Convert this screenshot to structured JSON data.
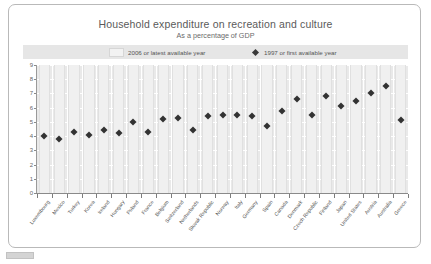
{
  "chart_data": {
    "type": "scatter",
    "title": "Household expenditure on recreation and culture",
    "subtitle": "As a percentage of GDP",
    "xlabel": "",
    "ylabel": "",
    "ylim": [
      0,
      9
    ],
    "ytick_labels": [
      "0",
      "1",
      "2",
      "3",
      "4",
      "5",
      "6",
      "7",
      "8",
      "9"
    ],
    "grid": true,
    "legend_position": "top",
    "legend": [
      {
        "label": "2006 or latest available year",
        "marker": "bar-swatch"
      },
      {
        "label": "1997 or first available year",
        "marker": "diamond"
      }
    ],
    "categories": [
      "Luxembourg",
      "Mexico",
      "Turkey",
      "Korea",
      "Ireland",
      "Hungary",
      "Poland",
      "France",
      "Belgium",
      "Switzerland",
      "Netherlands",
      "Slovak Republic",
      "Norway",
      "Italy",
      "Germany",
      "Spain",
      "Canada",
      "Denmark",
      "Czech Republic",
      "Finland",
      "Japan",
      "United States",
      "Austria",
      "Australia",
      "Greece"
    ],
    "series": [
      {
        "name": "1997 or first available year",
        "marker": "diamond",
        "color": "#333333",
        "values": [
          4.0,
          3.8,
          4.3,
          4.1,
          4.4,
          4.2,
          5.0,
          4.3,
          5.2,
          5.3,
          4.4,
          5.4,
          5.5,
          5.5,
          5.4,
          4.7,
          5.8,
          6.6,
          5.5,
          6.8,
          6.1,
          6.5,
          7.0,
          7.5,
          5.1
        ]
      }
    ]
  },
  "footer": {
    "chip_label": ""
  }
}
